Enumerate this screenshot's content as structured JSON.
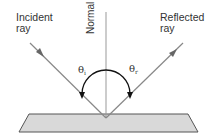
{
  "labels": {
    "incident_line1": "Incident",
    "incident_line2": "ray",
    "reflected_line1": "Reflected",
    "reflected_line2": "ray",
    "normal": "Normal",
    "theta_i_symbol": "θ",
    "theta_i_sub": "i",
    "theta_r_symbol": "θ",
    "theta_r_sub": "r"
  },
  "colors": {
    "ray": "#888888",
    "normal": "#999999",
    "arc": "#111111",
    "surface_fill": "#d9d9d9",
    "surface_stroke": "#555555",
    "text": "#333333"
  }
}
